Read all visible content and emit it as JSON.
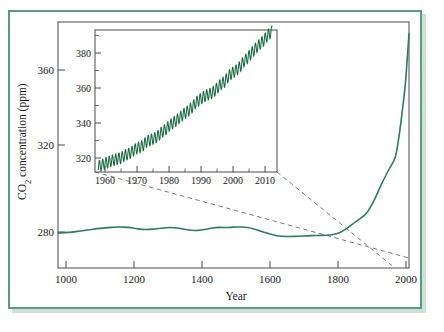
{
  "figure": {
    "title": "",
    "frame_color": "#5a9c81",
    "background": "#ffffff"
  },
  "chart_data": [
    {
      "id": "main",
      "type": "line",
      "title": "",
      "xlabel": "Year",
      "ylabel": "CO2 concentration (ppm)",
      "ylabel_display": "CO₂ concentration (ppm)",
      "xlim": [
        1000,
        2000
      ],
      "ylim": [
        255,
        395
      ],
      "xticks": [
        1000,
        1200,
        1400,
        1600,
        1800,
        2000
      ],
      "xticklabels": [
        "1000",
        "1200",
        "1400",
        "1600",
        "1800",
        "2000"
      ],
      "yticks": [
        280,
        320,
        360
      ],
      "yticklabels": [
        "280",
        "320",
        "360"
      ],
      "grid": false,
      "legend": "none",
      "series": [
        {
          "name": "Atmospheric CO2 (ice core + instrumental)",
          "color": "#2e7d5f",
          "x": [
            1000,
            1030,
            1060,
            1090,
            1120,
            1150,
            1175,
            1200,
            1225,
            1250,
            1275,
            1300,
            1320,
            1340,
            1360,
            1380,
            1400,
            1420,
            1440,
            1460,
            1480,
            1500,
            1520,
            1540,
            1560,
            1580,
            1600,
            1620,
            1640,
            1660,
            1680,
            1700,
            1720,
            1740,
            1760,
            1780,
            1800,
            1820,
            1840,
            1860,
            1880,
            1900,
            1920,
            1940,
            1960,
            1970,
            1980,
            1990,
            2000
          ],
          "y": [
            279.5,
            279.8,
            280.4,
            281.1,
            281.8,
            282.3,
            282.5,
            282.3,
            281.6,
            281.2,
            281.5,
            282.0,
            282.2,
            282.0,
            281.4,
            280.9,
            280.8,
            281.3,
            282.0,
            282.3,
            282.2,
            282.4,
            282.5,
            282.2,
            281.4,
            280.3,
            279.2,
            278.3,
            277.9,
            277.8,
            277.9,
            278.0,
            278.2,
            278.3,
            278.4,
            278.6,
            279.5,
            281.4,
            284.0,
            286.5,
            289.5,
            295.5,
            303.0,
            310.0,
            316.5,
            325.5,
            338.5,
            354.0,
            378.0
          ]
        }
      ]
    },
    {
      "id": "inset",
      "type": "line",
      "title": "",
      "xlabel": "",
      "ylabel": "",
      "xlim": [
        1957,
        2013
      ],
      "ylim": [
        312,
        393
      ],
      "xticks": [
        1960,
        1970,
        1980,
        1990,
        2000,
        2010
      ],
      "xticklabels": [
        "1960",
        "1970",
        "1980",
        "1990",
        "2000",
        "2010"
      ],
      "xticks_minor": [
        1965,
        1975,
        1985,
        1995,
        2005
      ],
      "yticks": [
        320,
        340,
        360,
        380
      ],
      "yticklabels": [
        "320",
        "340",
        "360",
        "380"
      ],
      "yticks_minor": [
        330,
        350,
        370,
        390
      ],
      "grid": false,
      "legend": "none",
      "series": [
        {
          "name": "Mauna Loa monthly mean CO2 (Keeling curve)",
          "color": "#1a6b42",
          "seasonal_amplitude_ppm": 3.2,
          "annual": {
            "x": [
              1958,
              1959,
              1960,
              1961,
              1962,
              1963,
              1964,
              1965,
              1966,
              1967,
              1968,
              1969,
              1970,
              1971,
              1972,
              1973,
              1974,
              1975,
              1976,
              1977,
              1978,
              1979,
              1980,
              1981,
              1982,
              1983,
              1984,
              1985,
              1986,
              1987,
              1988,
              1989,
              1990,
              1991,
              1992,
              1993,
              1994,
              1995,
              1996,
              1997,
              1998,
              1999,
              2000,
              2001,
              2002,
              2003,
              2004,
              2005,
              2006,
              2007,
              2008,
              2009,
              2010,
              2011
            ],
            "y": [
              315.3,
              315.9,
              316.9,
              317.6,
              318.4,
              318.9,
              319.6,
              320.0,
              321.4,
              322.2,
              323.0,
              324.6,
              325.7,
              326.3,
              327.5,
              329.7,
              330.2,
              331.1,
              332.0,
              333.8,
              335.4,
              336.8,
              338.7,
              340.1,
              341.4,
              343.0,
              344.6,
              346.0,
              347.4,
              349.2,
              351.6,
              353.1,
              354.4,
              355.6,
              356.4,
              357.1,
              358.8,
              360.8,
              362.6,
              363.8,
              366.6,
              368.3,
              369.5,
              371.0,
              373.1,
              375.6,
              377.4,
              379.6,
              381.8,
              383.7,
              385.6,
              387.4,
              389.8,
              391.6
            ]
          }
        }
      ]
    }
  ],
  "annotations": {
    "leader_lines": [
      {
        "name": "inset-leader-lower-left",
        "from": "inset-bottom-left",
        "to": "main-axis-year-1960"
      },
      {
        "name": "inset-leader-lower-right",
        "from": "inset-bottom-right",
        "to": "main-axis-year-2000"
      }
    ]
  }
}
